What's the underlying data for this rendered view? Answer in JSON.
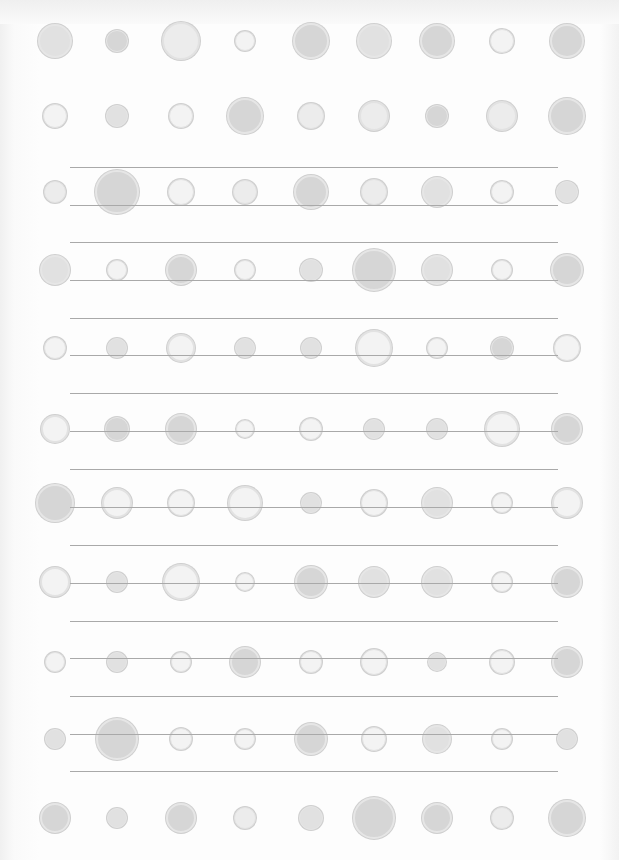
{
  "paper": {
    "background": "#fdfdfd",
    "line_color": "#a9a9a9",
    "line_left": 70,
    "line_right": 558,
    "lines_y": [
      167,
      205,
      242,
      280,
      318,
      355,
      393,
      431,
      469,
      507,
      545,
      583,
      621,
      658,
      696,
      734,
      771
    ]
  },
  "dots": {
    "columns_x": [
      55,
      117,
      181,
      245,
      311,
      374,
      437,
      502,
      567
    ],
    "rows": [
      {
        "y": 41,
        "d": [
          34,
          22,
          38,
          20,
          36,
          34,
          34,
          24,
          34
        ],
        "shade": [
          2,
          3,
          1,
          0,
          3,
          2,
          3,
          0,
          3
        ]
      },
      {
        "y": 116,
        "d": [
          24,
          22,
          24,
          36,
          26,
          30,
          22,
          30,
          36
        ],
        "shade": [
          0,
          2,
          0,
          3,
          1,
          1,
          3,
          1,
          3
        ]
      },
      {
        "y": 192,
        "d": [
          22,
          44,
          26,
          24,
          34,
          26,
          30,
          22,
          22
        ],
        "shade": [
          1,
          3,
          0,
          1,
          3,
          1,
          2,
          0,
          2
        ]
      },
      {
        "y": 270,
        "d": [
          30,
          20,
          30,
          20,
          22,
          42,
          30,
          20,
          32
        ],
        "shade": [
          2,
          0,
          3,
          0,
          2,
          3,
          2,
          0,
          3
        ]
      },
      {
        "y": 348,
        "d": [
          22,
          20,
          28,
          20,
          20,
          36,
          20,
          22,
          26
        ],
        "shade": [
          0,
          2,
          0,
          2,
          2,
          0,
          0,
          3,
          0
        ]
      },
      {
        "y": 429,
        "d": [
          28,
          24,
          30,
          18,
          22,
          20,
          20,
          34,
          30
        ],
        "shade": [
          0,
          3,
          3,
          0,
          0,
          2,
          2,
          0,
          3
        ]
      },
      {
        "y": 503,
        "d": [
          38,
          30,
          26,
          34,
          20,
          26,
          30,
          20,
          30
        ],
        "shade": [
          3,
          0,
          0,
          0,
          2,
          0,
          2,
          0,
          0
        ]
      },
      {
        "y": 582,
        "d": [
          30,
          20,
          36,
          18,
          32,
          30,
          30,
          20,
          30
        ],
        "shade": [
          0,
          2,
          0,
          0,
          3,
          2,
          2,
          0,
          3
        ]
      },
      {
        "y": 662,
        "d": [
          20,
          20,
          20,
          30,
          22,
          26,
          18,
          24,
          30
        ],
        "shade": [
          0,
          2,
          0,
          3,
          0,
          0,
          2,
          0,
          3
        ]
      },
      {
        "y": 739,
        "d": [
          20,
          42,
          22,
          20,
          32,
          24,
          28,
          20,
          20
        ],
        "shade": [
          2,
          3,
          0,
          0,
          3,
          0,
          2,
          0,
          2
        ]
      },
      {
        "y": 818,
        "d": [
          30,
          20,
          30,
          22,
          24,
          42,
          30,
          22,
          36
        ],
        "shade": [
          3,
          2,
          3,
          1,
          2,
          3,
          3,
          1,
          3
        ]
      }
    ],
    "fill_shades": [
      "#f3f3f3",
      "#ececec",
      "#e1e1e1",
      "#d6d6d6"
    ],
    "ring_color": "#cfcfcf"
  }
}
